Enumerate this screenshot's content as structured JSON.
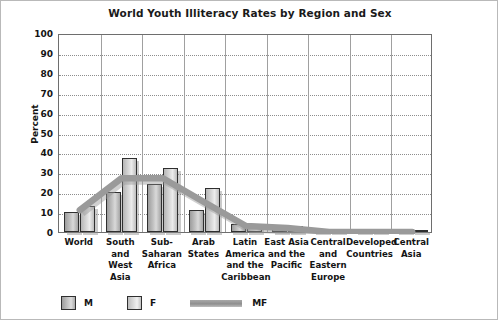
{
  "chart_data": {
    "type": "bar",
    "title": "World Youth Illiteracy Rates by Region and Sex",
    "xlabel": "",
    "ylabel": "Percent",
    "ylim": [
      0,
      100
    ],
    "ytick_step": 10,
    "yticks": [
      100,
      90,
      80,
      70,
      60,
      50,
      40,
      30,
      20,
      10,
      0
    ],
    "grid": "horizontal-dotted",
    "legend_position": "bottom-left",
    "categories": [
      "World",
      "South and West Asia",
      "Sub-Saharan Africa",
      "Arab States",
      "Latin America and the Caribbean",
      "East Asia and the Pacific",
      "Central and Eastern Europe",
      "Developed Countries",
      "Central Asia"
    ],
    "category_label_lines": [
      [
        "World"
      ],
      [
        "South",
        "and",
        "West Asia"
      ],
      [
        "Sub-",
        "Saharan",
        "Africa"
      ],
      [
        "Arab",
        "States"
      ],
      [
        "Latin",
        "America",
        "and the",
        "Caribbean"
      ],
      [
        "East Asia",
        "and the",
        "Pacific"
      ],
      [
        "Central",
        "and",
        "Eastern",
        "Europe"
      ],
      [
        "Developed",
        "Countries"
      ],
      [
        "Central",
        "Asia"
      ]
    ],
    "series": [
      {
        "name": "M",
        "type": "bar",
        "values": [
          10,
          20,
          24,
          11,
          4,
          2,
          1,
          1,
          1
        ]
      },
      {
        "name": "F",
        "type": "bar",
        "values": [
          13,
          37,
          32,
          22,
          3,
          3,
          1,
          1,
          1
        ]
      },
      {
        "name": "MF",
        "type": "line",
        "values": [
          12,
          28,
          28,
          16,
          4,
          3,
          1,
          1,
          1
        ]
      }
    ],
    "colors": {
      "bar_m": "#b8b8b8",
      "bar_f": "#d8d8d8",
      "line_mf": "#9a9a9a",
      "bar_outline": "#2f2f2f",
      "grid": "#8d8d8d",
      "axis": "#6e6e6e",
      "text": "#141414"
    }
  },
  "legend": {
    "items": [
      {
        "label": "M",
        "kind": "swatch-dark"
      },
      {
        "label": "F",
        "kind": "swatch-light"
      },
      {
        "label": "MF",
        "kind": "line"
      }
    ]
  }
}
